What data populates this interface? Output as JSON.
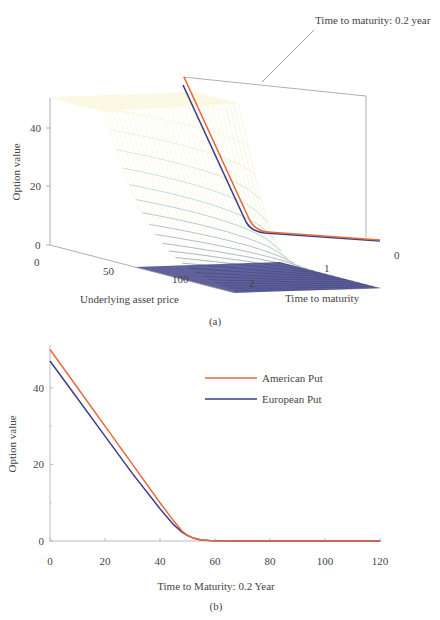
{
  "chart_data": [
    {
      "id": "a",
      "type": "surface",
      "caption": "(a)",
      "annotation": "Time to maturity: 0.2 year",
      "xlabel": "Underlying asset price",
      "ylabel": "Time to maturity",
      "zlabel": "Option value",
      "x_ticks": [
        "0",
        "50",
        "100"
      ],
      "y_ticks": [
        "0",
        "1",
        "2"
      ],
      "z_ticks": [
        "0",
        "20",
        "40"
      ],
      "xlim": [
        0,
        120
      ],
      "ylim": [
        0,
        2
      ],
      "zlim": [
        0,
        50
      ],
      "colormap": [
        "#2b2f7a",
        "#3b6aa8",
        "#4fb0c6",
        "#8fcf9a",
        "#e8e39a",
        "#f6f0c0"
      ],
      "highlight_slice": {
        "time_to_maturity": 0.2,
        "series": [
          {
            "name": "American Put",
            "color": "#e8693a"
          },
          {
            "name": "European Put",
            "color": "#3a3f8a"
          }
        ]
      }
    },
    {
      "id": "b",
      "type": "line",
      "caption": "(b)",
      "title": "",
      "xlabel": "Time to Maturity: 0.2 Year",
      "ylabel": "Option value",
      "xlim": [
        0,
        120
      ],
      "ylim": [
        0,
        50
      ],
      "x_ticks": [
        0,
        20,
        40,
        60,
        80,
        100,
        120
      ],
      "y_ticks": [
        0,
        20,
        40
      ],
      "y_minor_ticks": [
        10,
        30
      ],
      "grid": false,
      "legend_position": "upper right",
      "x": [
        0,
        10,
        20,
        30,
        40,
        45,
        48,
        50,
        52,
        55,
        58,
        60,
        70,
        80,
        90,
        100,
        110,
        120
      ],
      "series": [
        {
          "name": "American Put",
          "color": "#e8693a",
          "values": [
            50,
            40,
            30,
            20,
            10,
            5.2,
            2.6,
            1.5,
            0.8,
            0.3,
            0.1,
            0.05,
            0,
            0,
            0,
            0,
            0,
            0
          ]
        },
        {
          "name": "European Put",
          "color": "#3a3f8a",
          "values": [
            47,
            37.2,
            27.4,
            17.6,
            8.4,
            4.2,
            2.3,
            1.4,
            0.8,
            0.3,
            0.1,
            0.05,
            0,
            0,
            0,
            0,
            0,
            0
          ]
        }
      ]
    }
  ]
}
